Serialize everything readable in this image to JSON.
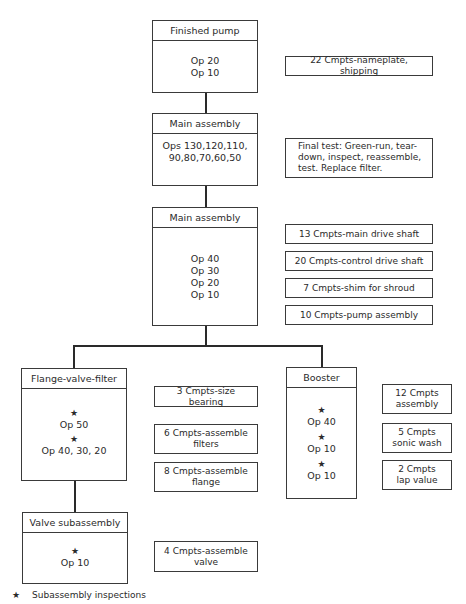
{
  "diagram": {
    "type": "assembly-process-flow",
    "nodes": [
      {
        "id": "finished-pump",
        "title": "Finished pump",
        "ops": [
          "Op 20",
          "Op 10"
        ],
        "starred": []
      },
      {
        "id": "main-assembly-1",
        "title": "Main assembly",
        "ops": [
          "Ops 130,120,110,",
          "90,80,70,60,50"
        ],
        "starred": []
      },
      {
        "id": "main-assembly-2",
        "title": "Main assembly",
        "ops": [
          "Op 40",
          "Op 30",
          "Op 20",
          "Op 10"
        ],
        "starred": []
      },
      {
        "id": "flange-valve-filter",
        "title": "Flange-valve-filter",
        "ops": [
          "Op 50",
          "Op 40, 30, 20"
        ],
        "starred": [
          true,
          true
        ]
      },
      {
        "id": "booster",
        "title": "Booster",
        "ops": [
          "Op 40",
          "Op 10",
          "Op 10"
        ],
        "starred": [
          true,
          true,
          true
        ]
      },
      {
        "id": "valve-subassembly",
        "title": "Valve subassembly",
        "ops": [
          "Op 10"
        ],
        "starred": [
          true
        ]
      }
    ],
    "edges": [
      {
        "from": "main-assembly-1",
        "to": "finished-pump"
      },
      {
        "from": "main-assembly-2",
        "to": "main-assembly-1"
      },
      {
        "from": "flange-valve-filter",
        "to": "main-assembly-2"
      },
      {
        "from": "booster",
        "to": "main-assembly-2"
      },
      {
        "from": "valve-subassembly",
        "to": "flange-valve-filter"
      }
    ],
    "notes": {
      "finished_pump": [
        "22 Cmpts-nameplate, shipping"
      ],
      "main_assembly_1": [
        "Final test: Green-run, tear-down, inspect, reassemble, test. Replace filter."
      ],
      "main_assembly_2": [
        "13 Cmpts-main drive shaft",
        "20 Cmpts-control drive shaft",
        "7 Cmpts-shim for shroud",
        "10 Cmpts-pump assembly"
      ],
      "flange_valve_filter": [
        "3 Cmpts-size bearing",
        "6 Cmpts-assemble filters",
        "8 Cmpts-assemble flange"
      ],
      "booster": [
        "12 Cmpts assembly",
        "5 Cmpts sonic wash",
        "2 Cmpts lap value"
      ],
      "valve_subassembly": [
        "4 Cmpts-assemble valve"
      ]
    },
    "legend": {
      "symbol": "★",
      "label": "Subassembly inspections"
    }
  },
  "labels": {
    "star": "★",
    "fp_title": "Finished pump",
    "fp_op1": "Op 20",
    "fp_op2": "Op 10",
    "ma1_title": "Main assembly",
    "ma1_op1": "Ops 130,120,110,",
    "ma1_op2": "90,80,70,60,50",
    "ma2_title": "Main assembly",
    "ma2_op1": "Op 40",
    "ma2_op2": "Op 30",
    "ma2_op3": "Op 20",
    "ma2_op4": "Op 10",
    "fvf_title": "Flange-valve-filter",
    "fvf_op1": "Op 50",
    "fvf_op2": "Op 40, 30, 20",
    "bst_title": "Booster",
    "bst_op1": "Op 40",
    "bst_op2": "Op 10",
    "bst_op3": "Op 10",
    "vs_title": "Valve subassembly",
    "vs_op1": "Op 10",
    "n_fp": "22 Cmpts-nameplate, shipping",
    "n_ma1_l1": "Final test: Green-run, tear-",
    "n_ma1_l2": "down, inspect, reassemble,",
    "n_ma1_l3": "test. Replace filter.",
    "n_ma2_1": "13 Cmpts-main drive shaft",
    "n_ma2_2": "20 Cmpts-control drive shaft",
    "n_ma2_3": "7 Cmpts-shim for shroud",
    "n_ma2_4": "10 Cmpts-pump assembly",
    "n_fvf_1": "3 Cmpts-size bearing",
    "n_fvf_2a": "6 Cmpts-assemble",
    "n_fvf_2b": "filters",
    "n_fvf_3a": "8 Cmpts-assemble",
    "n_fvf_3b": "flange",
    "n_bst_1a": "12 Cmpts",
    "n_bst_1b": "assembly",
    "n_bst_2a": "5 Cmpts",
    "n_bst_2b": "sonic wash",
    "n_bst_3a": "2 Cmpts",
    "n_bst_3b": "lap value",
    "n_vs_a": "4 Cmpts-assemble",
    "n_vs_b": "valve",
    "legend_label": "Subassembly inspections"
  }
}
